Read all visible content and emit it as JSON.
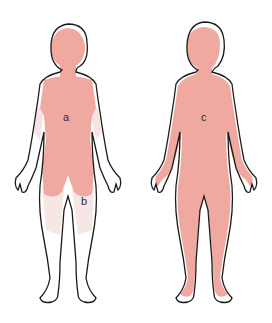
{
  "diagram": {
    "type": "body distribution diagram",
    "colors": {
      "outline": "#1a1a1a",
      "primary_region": "#f0a9a0",
      "secondary_region": "#f7e4e2",
      "background": "#ffffff"
    },
    "figures": [
      {
        "id": "left",
        "regions": [
          {
            "label": "a",
            "description": "head, neck, trunk, upper arms (proximal)"
          },
          {
            "label": "b",
            "description": "upper arms and thighs (faint)"
          }
        ]
      },
      {
        "id": "right",
        "regions": [
          {
            "label": "c",
            "description": "entire body"
          }
        ]
      }
    ]
  }
}
